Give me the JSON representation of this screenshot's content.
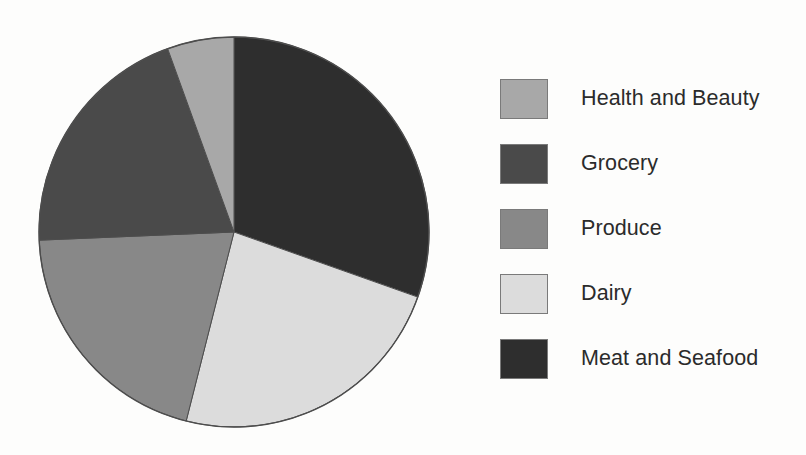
{
  "chart_data": {
    "type": "pie",
    "title": "",
    "labels": [
      "Health and Beauty",
      "Grocery",
      "Produce",
      "Dairy",
      "Meat and Seafood"
    ],
    "values": [
      5.5,
      20.1,
      20.4,
      23.5,
      30.4
    ],
    "units": "percent",
    "slice_angles_deg": [
      19.9,
      72.5,
      73.4,
      84.7,
      109.5
    ],
    "start_angle_deg": 0,
    "direction": "clockwise",
    "draw_order_clockwise_from_top": [
      "Meat and Seafood",
      "Dairy",
      "Produce",
      "Grocery",
      "Health and Beauty"
    ],
    "colors": [
      "#a8a8a8",
      "#4a4a4a",
      "#888888",
      "#dcdcdc",
      "#2e2e2e"
    ],
    "legend_position": "right",
    "grid": false,
    "xlabel": "",
    "ylabel": ""
  },
  "legend": {
    "items": [
      {
        "label": "Health and Beauty",
        "color": "#a8a8a8",
        "value": 5.5
      },
      {
        "label": "Grocery",
        "color": "#4a4a4a",
        "value": 20.1
      },
      {
        "label": "Produce",
        "color": "#888888",
        "value": 20.4
      },
      {
        "label": "Dairy",
        "color": "#dcdcdc",
        "value": 23.5
      },
      {
        "label": "Meat and Seafood",
        "color": "#2e2e2e",
        "value": 30.4
      }
    ]
  },
  "pie": {
    "center_x": 198,
    "center_y": 197,
    "radius": 195,
    "outline_color": "#4d4d4d",
    "slices": [
      {
        "name": "Meat and Seafood",
        "color": "#2e2e2e",
        "start_deg": 0.0,
        "end_deg": 109.5
      },
      {
        "name": "Dairy",
        "color": "#dcdcdc",
        "start_deg": 109.5,
        "end_deg": 194.2
      },
      {
        "name": "Produce",
        "color": "#888888",
        "start_deg": 194.2,
        "end_deg": 267.6
      },
      {
        "name": "Grocery",
        "color": "#4a4a4a",
        "start_deg": 267.6,
        "end_deg": 340.1
      },
      {
        "name": "Health and Beauty",
        "color": "#a8a8a8",
        "start_deg": 340.1,
        "end_deg": 360.0
      }
    ]
  },
  "background_color": "#fdfdfc"
}
